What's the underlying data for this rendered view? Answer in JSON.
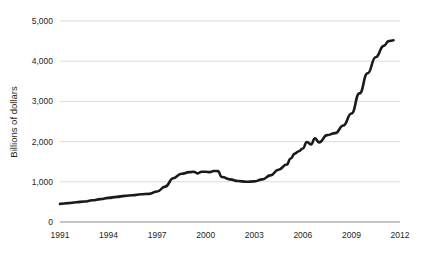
{
  "chart_data": {
    "type": "line",
    "title": "",
    "subtitle": "",
    "xlabel": "",
    "ylabel": "Billions of dollars",
    "xlim": [
      1991,
      2012
    ],
    "ylim": [
      0,
      5000
    ],
    "grid": true,
    "legend": false,
    "legend_position": "none",
    "line_color": "#1a1a1a",
    "gridline_color": "#d7d7d7",
    "axis_color": "#8a8a8a",
    "background_color": "#ffffff",
    "y_ticks": [
      0,
      1000,
      2000,
      3000,
      4000,
      5000
    ],
    "y_tick_labels": [
      "0",
      "1,000",
      "2,000",
      "3,000",
      "4,000",
      "5,000"
    ],
    "x_ticks": [
      1991,
      1994,
      1997,
      2000,
      2003,
      2006,
      2009,
      2012
    ],
    "x_tick_labels": [
      "1991",
      "1994",
      "1997",
      "2000",
      "2003",
      "2006",
      "2009",
      "2012"
    ],
    "series": [
      {
        "name": "Billions of dollars",
        "x": [
          1991.0,
          1991.5,
          1992.0,
          1992.5,
          1993.0,
          1993.5,
          1994.0,
          1994.5,
          1995.0,
          1995.5,
          1996.0,
          1996.5,
          1997.0,
          1997.5,
          1998.0,
          1998.5,
          1999.0,
          1999.25,
          1999.5,
          1999.75,
          2000.0,
          2000.25,
          2000.5,
          2000.75,
          2001.0,
          2001.5,
          2002.0,
          2002.5,
          2003.0,
          2003.5,
          2004.0,
          2004.5,
          2005.0,
          2005.25,
          2005.5,
          2005.75,
          2006.0,
          2006.25,
          2006.5,
          2006.75,
          2007.0,
          2007.5,
          2008.0,
          2008.5,
          2009.0,
          2009.5,
          2010.0,
          2010.5,
          2011.0,
          2011.3,
          2011.6
        ],
        "values": [
          450,
          470,
          490,
          510,
          540,
          570,
          600,
          625,
          650,
          665,
          690,
          700,
          760,
          880,
          1090,
          1200,
          1240,
          1250,
          1210,
          1250,
          1250,
          1240,
          1270,
          1265,
          1120,
          1060,
          1020,
          1000,
          1010,
          1060,
          1160,
          1300,
          1430,
          1580,
          1700,
          1760,
          1830,
          1990,
          1930,
          2080,
          1980,
          2160,
          2210,
          2400,
          2700,
          3200,
          3700,
          4100,
          4380,
          4500,
          4520
        ]
      }
    ],
    "annotations": []
  },
  "figure": {
    "plot_area": {
      "left": 60,
      "right": 400,
      "top": 21,
      "bottom": 222
    }
  }
}
